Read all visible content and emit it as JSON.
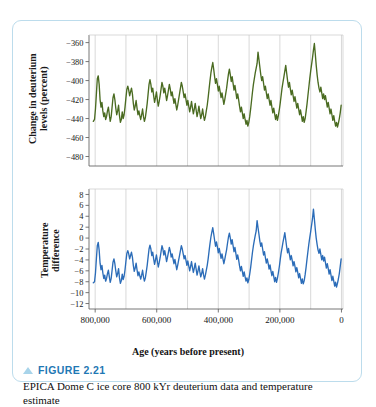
{
  "figure": {
    "number_label": "FIGURE 2.21",
    "caption": "EPICA Dome C ice core 800 kYr deuterium data and temperature estimate",
    "marker_icon": "triangle-up-icon",
    "border_color": "#bcdcec",
    "accent_color": "#1f78b4"
  },
  "ghost_text": "",
  "axis": {
    "x_title": "Age (years before present)",
    "x_ticks": [
      "800,000",
      "600,000",
      "400,000",
      "200,000",
      "0"
    ],
    "x_tick_values": [
      800000,
      600000,
      400000,
      200000,
      0
    ],
    "x_range": [
      820000,
      -5000
    ],
    "x_reversed": true
  },
  "chart_data": [
    {
      "type": "line",
      "name": "deuterium",
      "title": "",
      "xlabel": "Age (years before present)",
      "ylabel": "Change in deuterium\nlevels (percent)",
      "ylabel_line1": "Change in deuterium",
      "ylabel_line2": "levels (percent)",
      "color": "#4a6b21",
      "grid": true,
      "gridlines_x": [
        800000,
        700000,
        600000,
        500000,
        400000,
        300000,
        200000,
        100000,
        0
      ],
      "xlim": [
        820000,
        -5000
      ],
      "ylim": [
        -490,
        -352
      ],
      "y_ticks": [
        -360,
        -380,
        -400,
        -420,
        -440,
        -460,
        -480
      ],
      "y_tick_labels": [
        "−360",
        "−380",
        "−400",
        "−420",
        "−440",
        "−460",
        "−480"
      ],
      "x": [
        806000,
        802000,
        799000,
        796000,
        793000,
        790000,
        787000,
        784000,
        781000,
        778000,
        775000,
        772000,
        769000,
        766000,
        763000,
        760000,
        757000,
        754000,
        751000,
        748000,
        745000,
        742000,
        739000,
        736000,
        733000,
        730000,
        727000,
        724000,
        721000,
        718000,
        715000,
        712000,
        709000,
        706000,
        703000,
        700000,
        697000,
        694000,
        691000,
        688000,
        685000,
        682000,
        679000,
        676000,
        673000,
        670000,
        667000,
        664000,
        661000,
        658000,
        655000,
        652000,
        649000,
        646000,
        643000,
        640000,
        637000,
        634000,
        631000,
        628000,
        625000,
        622000,
        619000,
        616000,
        613000,
        610000,
        607000,
        604000,
        601000,
        598000,
        595000,
        592000,
        589000,
        586000,
        583000,
        580000,
        577000,
        574000,
        571000,
        568000,
        565000,
        562000,
        559000,
        556000,
        553000,
        550000,
        547000,
        544000,
        541000,
        538000,
        535000,
        532000,
        529000,
        526000,
        523000,
        520000,
        517000,
        514000,
        511000,
        508000,
        505000,
        502000,
        499000,
        496000,
        493000,
        490000,
        487000,
        484000,
        481000,
        478000,
        475000,
        472000,
        469000,
        466000,
        463000,
        460000,
        457000,
        454000,
        451000,
        448000,
        445000,
        442000,
        439000,
        436000,
        433000,
        430000,
        427000,
        424000,
        421000,
        418000,
        415000,
        412000,
        409000,
        406000,
        403000,
        400000,
        397000,
        394000,
        391000,
        388000,
        385000,
        382000,
        379000,
        376000,
        373000,
        370000,
        367000,
        364000,
        361000,
        358000,
        355000,
        352000,
        349000,
        346000,
        343000,
        340000,
        337000,
        334000,
        331000,
        328000,
        325000,
        322000,
        319000,
        316000,
        313000,
        310000,
        307000,
        304000,
        301000,
        298000,
        295000,
        292000,
        289000,
        286000,
        283000,
        280000,
        277000,
        274000,
        271000,
        268000,
        265000,
        262000,
        259000,
        256000,
        253000,
        250000,
        247000,
        244000,
        241000,
        238000,
        235000,
        232000,
        229000,
        226000,
        223000,
        220000,
        217000,
        214000,
        211000,
        208000,
        205000,
        202000,
        199000,
        196000,
        193000,
        190000,
        187000,
        184000,
        181000,
        178000,
        175000,
        172000,
        169000,
        166000,
        163000,
        160000,
        157000,
        154000,
        151000,
        148000,
        145000,
        142000,
        139000,
        136000,
        133000,
        130000,
        127000,
        124000,
        121000,
        118000,
        115000,
        112000,
        109000,
        106000,
        103000,
        100000,
        97000,
        94000,
        91000,
        88000,
        85000,
        82000,
        79000,
        76000,
        73000,
        70000,
        67000,
        64000,
        61000,
        58000,
        55000,
        52000,
        49000,
        46000,
        43000,
        40000,
        37000,
        34000,
        31000,
        28000,
        25000,
        22000,
        19000,
        16000,
        13000,
        10000,
        7000,
        4000,
        1000
      ],
      "y": [
        -443,
        -441,
        -430,
        -414,
        -398,
        -395,
        -404,
        -420,
        -428,
        -423,
        -432,
        -438,
        -434,
        -441,
        -438,
        -432,
        -428,
        -436,
        -443,
        -438,
        -428,
        -418,
        -414,
        -420,
        -429,
        -436,
        -432,
        -426,
        -437,
        -444,
        -441,
        -433,
        -440,
        -436,
        -428,
        -418,
        -409,
        -406,
        -410,
        -416,
        -412,
        -408,
        -414,
        -424,
        -431,
        -427,
        -421,
        -429,
        -436,
        -432,
        -437,
        -441,
        -436,
        -430,
        -438,
        -443,
        -439,
        -432,
        -424,
        -414,
        -404,
        -399,
        -404,
        -412,
        -408,
        -416,
        -423,
        -418,
        -412,
        -420,
        -427,
        -422,
        -416,
        -409,
        -402,
        -406,
        -413,
        -408,
        -414,
        -421,
        -416,
        -410,
        -404,
        -409,
        -416,
        -412,
        -418,
        -424,
        -419,
        -425,
        -431,
        -426,
        -420,
        -414,
        -408,
        -402,
        -406,
        -412,
        -418,
        -414,
        -420,
        -426,
        -421,
        -427,
        -433,
        -428,
        -422,
        -429,
        -435,
        -430,
        -424,
        -431,
        -438,
        -433,
        -427,
        -434,
        -440,
        -436,
        -430,
        -437,
        -442,
        -438,
        -432,
        -426,
        -418,
        -409,
        -400,
        -392,
        -386,
        -381,
        -388,
        -396,
        -403,
        -398,
        -404,
        -411,
        -406,
        -412,
        -418,
        -413,
        -419,
        -425,
        -420,
        -414,
        -408,
        -400,
        -393,
        -388,
        -394,
        -401,
        -396,
        -403,
        -410,
        -405,
        -412,
        -419,
        -414,
        -420,
        -427,
        -433,
        -428,
        -434,
        -440,
        -435,
        -441,
        -446,
        -442,
        -448,
        -444,
        -438,
        -430,
        -421,
        -412,
        -404,
        -398,
        -392,
        -387,
        -382,
        -370,
        -378,
        -386,
        -394,
        -400,
        -396,
        -403,
        -410,
        -406,
        -413,
        -419,
        -414,
        -420,
        -426,
        -421,
        -428,
        -434,
        -429,
        -435,
        -441,
        -436,
        -442,
        -437,
        -431,
        -424,
        -416,
        -408,
        -402,
        -396,
        -390,
        -384,
        -392,
        -400,
        -407,
        -402,
        -409,
        -415,
        -410,
        -416,
        -422,
        -417,
        -423,
        -429,
        -424,
        -430,
        -436,
        -431,
        -437,
        -443,
        -438,
        -444,
        -440,
        -433,
        -425,
        -416,
        -407,
        -398,
        -390,
        -383,
        -376,
        -368,
        -361,
        -372,
        -384,
        -394,
        -402,
        -408,
        -412,
        -407,
        -413,
        -419,
        -414,
        -420,
        -416,
        -422,
        -428,
        -423,
        -429,
        -435,
        -430,
        -436,
        -442,
        -437,
        -443,
        -448,
        -444,
        -449,
        -445,
        -440,
        -434,
        -426,
        -417,
        -407,
        -397,
        -388,
        -380,
        -386,
        -394,
        -400,
        -408,
        -412
      ]
    },
    {
      "type": "line",
      "name": "temperature",
      "title": "",
      "xlabel": "Age (years before present)",
      "ylabel": "Temperature\ndifference",
      "ylabel_line1": "Temperature",
      "ylabel_line2": "difference",
      "color": "#2b6cb8",
      "grid": true,
      "gridlines_x": [
        800000,
        700000,
        600000,
        500000,
        400000,
        300000,
        200000,
        100000,
        0
      ],
      "xlim": [
        820000,
        -5000
      ],
      "ylim": [
        -13,
        9
      ],
      "y_ticks": [
        8,
        6,
        4,
        2,
        0,
        -2,
        -4,
        -6,
        -8,
        -10,
        -12
      ],
      "y_tick_labels": [
        "8",
        "6",
        "4",
        "2",
        "0",
        "−2",
        "−4",
        "−6",
        "−8",
        "−10",
        "−12"
      ],
      "x": [
        806000,
        802000,
        799000,
        796000,
        793000,
        790000,
        787000,
        784000,
        781000,
        778000,
        775000,
        772000,
        769000,
        766000,
        763000,
        760000,
        757000,
        754000,
        751000,
        748000,
        745000,
        742000,
        739000,
        736000,
        733000,
        730000,
        727000,
        724000,
        721000,
        718000,
        715000,
        712000,
        709000,
        706000,
        703000,
        700000,
        697000,
        694000,
        691000,
        688000,
        685000,
        682000,
        679000,
        676000,
        673000,
        670000,
        667000,
        664000,
        661000,
        658000,
        655000,
        652000,
        649000,
        646000,
        643000,
        640000,
        637000,
        634000,
        631000,
        628000,
        625000,
        622000,
        619000,
        616000,
        613000,
        610000,
        607000,
        604000,
        601000,
        598000,
        595000,
        592000,
        589000,
        586000,
        583000,
        580000,
        577000,
        574000,
        571000,
        568000,
        565000,
        562000,
        559000,
        556000,
        553000,
        550000,
        547000,
        544000,
        541000,
        538000,
        535000,
        532000,
        529000,
        526000,
        523000,
        520000,
        517000,
        514000,
        511000,
        508000,
        505000,
        502000,
        499000,
        496000,
        493000,
        490000,
        487000,
        484000,
        481000,
        478000,
        475000,
        472000,
        469000,
        466000,
        463000,
        460000,
        457000,
        454000,
        451000,
        448000,
        445000,
        442000,
        439000,
        436000,
        433000,
        430000,
        427000,
        424000,
        421000,
        418000,
        415000,
        412000,
        409000,
        406000,
        403000,
        400000,
        397000,
        394000,
        391000,
        388000,
        385000,
        382000,
        379000,
        376000,
        373000,
        370000,
        367000,
        364000,
        361000,
        358000,
        355000,
        352000,
        349000,
        346000,
        343000,
        340000,
        337000,
        334000,
        331000,
        328000,
        325000,
        322000,
        319000,
        316000,
        313000,
        310000,
        307000,
        304000,
        301000,
        298000,
        295000,
        292000,
        289000,
        286000,
        283000,
        280000,
        277000,
        274000,
        271000,
        268000,
        265000,
        262000,
        259000,
        256000,
        253000,
        250000,
        247000,
        244000,
        241000,
        238000,
        235000,
        232000,
        229000,
        226000,
        223000,
        220000,
        217000,
        214000,
        211000,
        208000,
        205000,
        202000,
        199000,
        196000,
        193000,
        190000,
        187000,
        184000,
        181000,
        178000,
        175000,
        172000,
        169000,
        166000,
        163000,
        160000,
        157000,
        154000,
        151000,
        148000,
        145000,
        142000,
        139000,
        136000,
        133000,
        130000,
        127000,
        124000,
        121000,
        118000,
        115000,
        112000,
        109000,
        106000,
        103000,
        100000,
        97000,
        94000,
        91000,
        88000,
        85000,
        82000,
        79000,
        76000,
        73000,
        70000,
        67000,
        64000,
        61000,
        58000,
        55000,
        52000,
        49000,
        46000,
        43000,
        40000,
        37000,
        34000,
        31000,
        28000,
        25000,
        22000,
        19000,
        16000,
        13000,
        10000,
        7000,
        4000,
        1000
      ],
      "y": [
        -8.2,
        -8.0,
        -6.4,
        -3.8,
        -1.4,
        -0.8,
        -2.2,
        -4.6,
        -5.8,
        -5.0,
        -6.4,
        -7.4,
        -6.8,
        -7.9,
        -7.4,
        -6.5,
        -5.9,
        -7.1,
        -8.1,
        -7.4,
        -5.9,
        -4.4,
        -3.8,
        -4.7,
        -6.0,
        -7.1,
        -6.5,
        -5.6,
        -7.3,
        -8.3,
        -7.8,
        -6.6,
        -7.6,
        -7.0,
        -5.8,
        -4.2,
        -2.8,
        -2.3,
        -2.9,
        -3.8,
        -3.2,
        -2.6,
        -3.5,
        -5.0,
        -6.1,
        -5.5,
        -4.6,
        -5.8,
        -6.9,
        -6.2,
        -6.9,
        -7.5,
        -6.8,
        -5.9,
        -7.1,
        -7.9,
        -7.3,
        -6.2,
        -5.0,
        -3.5,
        -2.0,
        -1.3,
        -2.0,
        -3.2,
        -2.6,
        -3.8,
        -4.8,
        -4.0,
        -3.1,
        -4.2,
        -5.3,
        -4.5,
        -3.6,
        -2.5,
        -1.4,
        -2.0,
        -3.1,
        -2.3,
        -3.2,
        -4.3,
        -3.5,
        -2.6,
        -1.7,
        -2.4,
        -3.5,
        -2.9,
        -3.8,
        -4.7,
        -3.9,
        -4.8,
        -5.8,
        -5.0,
        -4.1,
        -3.2,
        -2.3,
        -1.4,
        -2.0,
        -2.9,
        -3.8,
        -3.2,
        -4.1,
        -5.0,
        -4.2,
        -5.1,
        -6.0,
        -5.2,
        -4.3,
        -5.4,
        -6.3,
        -5.5,
        -4.6,
        -5.7,
        -6.8,
        -6.0,
        -5.1,
        -6.2,
        -7.1,
        -6.5,
        -5.6,
        -6.7,
        -7.5,
        -6.8,
        -5.9,
        -5.0,
        -3.8,
        -2.4,
        -1.0,
        0.2,
        1.1,
        1.9,
        0.8,
        -0.4,
        -1.5,
        -0.7,
        -1.6,
        -2.7,
        -1.9,
        -2.8,
        -3.7,
        -2.9,
        -3.8,
        -4.7,
        -3.9,
        -3.0,
        -2.1,
        -0.9,
        0.2,
        0.9,
        0.0,
        -1.1,
        -0.3,
        -1.4,
        -2.5,
        -1.7,
        -2.8,
        -3.9,
        -3.1,
        -4.0,
        -5.1,
        -6.0,
        -5.2,
        -6.1,
        -7.0,
        -6.2,
        -7.1,
        -7.9,
        -7.3,
        -8.2,
        -7.6,
        -6.6,
        -5.4,
        -4.0,
        -2.6,
        -1.4,
        -0.4,
        0.5,
        1.3,
        3.2,
        1.9,
        0.7,
        -0.6,
        -1.5,
        -0.9,
        -2.0,
        -3.1,
        -2.5,
        -3.6,
        -4.6,
        -3.8,
        -4.7,
        -5.7,
        -4.9,
        -6.0,
        -6.9,
        -6.1,
        -7.0,
        -8.0,
        -7.2,
        -8.1,
        -7.4,
        -6.4,
        -5.3,
        -4.0,
        -2.7,
        -1.8,
        -0.8,
        0.1,
        1.0,
        -0.3,
        -1.6,
        -2.7,
        -1.9,
        -3.0,
        -4.0,
        -3.2,
        -4.1,
        -5.1,
        -4.3,
        -5.2,
        -6.2,
        -5.4,
        -6.3,
        -7.3,
        -6.5,
        -7.4,
        -8.3,
        -7.5,
        -8.4,
        -7.8,
        -6.7,
        -5.4,
        -3.9,
        -2.5,
        -1.1,
        0.1,
        1.2,
        2.4,
        3.6,
        5.3,
        3.5,
        1.6,
        0.0,
        -1.2,
        -2.2,
        -2.8,
        -2.0,
        -3.0,
        -4.0,
        -3.2,
        -4.2,
        -3.5,
        -4.5,
        -5.5,
        -4.7,
        -5.6,
        -6.6,
        -5.8,
        -6.8,
        -7.8,
        -7.0,
        -7.9,
        -8.8,
        -8.1,
        -9.0,
        -8.3,
        -7.5,
        -6.5,
        -5.2,
        -3.8,
        -2.2,
        -0.6,
        0.7,
        -0.3,
        -1.6,
        -2.6,
        -3.9,
        -4.6
      ]
    }
  ]
}
